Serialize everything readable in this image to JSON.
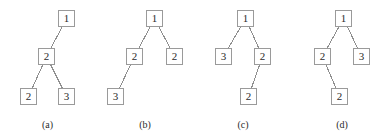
{
  "figure": {
    "width": 392,
    "height": 139,
    "background": "#ffffff",
    "node_stroke": "#9a9a9a",
    "edge_stroke": "#8f8f8f",
    "text_color": "#2b2b2b",
    "node_size": 17
  },
  "panels": [
    {
      "id": "panel-a",
      "caption": "(a)",
      "caption_y": 119,
      "offset_x": 0,
      "nodes": [
        {
          "id": "a-root",
          "label": "1",
          "x": 58,
          "y": 10
        },
        {
          "id": "a-n2",
          "label": "2",
          "x": 38,
          "y": 48
        },
        {
          "id": "a-n3",
          "label": "2",
          "x": 20,
          "y": 88
        },
        {
          "id": "a-n4",
          "label": "3",
          "x": 58,
          "y": 88
        }
      ],
      "edges": [
        {
          "from": "a-root",
          "to": "a-n2"
        },
        {
          "from": "a-n2",
          "to": "a-n3"
        },
        {
          "from": "a-n2",
          "to": "a-n4"
        }
      ]
    },
    {
      "id": "panel-b",
      "caption": "(b)",
      "caption_y": 119,
      "offset_x": 0,
      "nodes": [
        {
          "id": "b-root",
          "label": "1",
          "x": 146,
          "y": 10
        },
        {
          "id": "b-n2",
          "label": "2",
          "x": 126,
          "y": 48
        },
        {
          "id": "b-n3",
          "label": "2",
          "x": 166,
          "y": 48
        },
        {
          "id": "b-n4",
          "label": "3",
          "x": 107,
          "y": 88
        }
      ],
      "edges": [
        {
          "from": "b-root",
          "to": "b-n2"
        },
        {
          "from": "b-root",
          "to": "b-n3"
        },
        {
          "from": "b-n2",
          "to": "b-n4"
        }
      ]
    },
    {
      "id": "panel-c",
      "caption": "(c)",
      "caption_y": 119,
      "offset_x": 0,
      "nodes": [
        {
          "id": "c-root",
          "label": "1",
          "x": 237,
          "y": 10
        },
        {
          "id": "c-n2",
          "label": "3",
          "x": 215,
          "y": 48
        },
        {
          "id": "c-n3",
          "label": "2",
          "x": 254,
          "y": 48
        },
        {
          "id": "c-n4",
          "label": "2",
          "x": 240,
          "y": 88
        }
      ],
      "edges": [
        {
          "from": "c-root",
          "to": "c-n2"
        },
        {
          "from": "c-root",
          "to": "c-n3"
        },
        {
          "from": "c-n3",
          "to": "c-n4"
        }
      ]
    },
    {
      "id": "panel-d",
      "caption": "(d)",
      "caption_y": 119,
      "offset_x": 0,
      "nodes": [
        {
          "id": "d-root",
          "label": "1",
          "x": 335,
          "y": 10
        },
        {
          "id": "d-n2",
          "label": "2",
          "x": 314,
          "y": 48
        },
        {
          "id": "d-n3",
          "label": "3",
          "x": 353,
          "y": 48
        },
        {
          "id": "d-n4",
          "label": "2",
          "x": 331,
          "y": 88
        }
      ],
      "edges": [
        {
          "from": "d-root",
          "to": "d-n2"
        },
        {
          "from": "d-root",
          "to": "d-n3"
        },
        {
          "from": "d-n2",
          "to": "d-n4"
        }
      ]
    }
  ]
}
